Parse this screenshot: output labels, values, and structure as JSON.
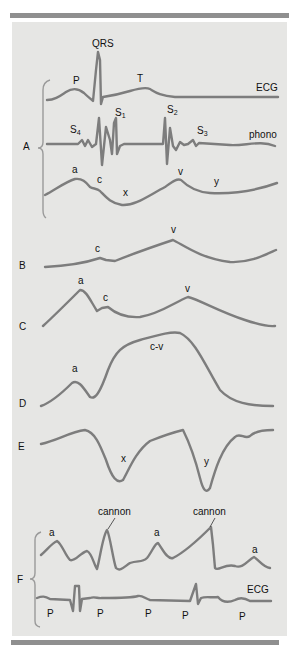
{
  "figure": {
    "panels": [
      {
        "id": "A",
        "label": "A",
        "traces": [
          {
            "name": "ECG",
            "label": "ECG",
            "annotations": [
              "P",
              "QRS",
              "T"
            ]
          },
          {
            "name": "phono",
            "label": "phono",
            "annotations": [
              "S4",
              "S1",
              "S2",
              "S3"
            ]
          },
          {
            "name": "jvp",
            "label": "",
            "annotations": [
              "a",
              "c",
              "x",
              "v",
              "y"
            ]
          }
        ]
      },
      {
        "id": "B",
        "label": "B",
        "annotations": [
          "c",
          "v"
        ]
      },
      {
        "id": "C",
        "label": "C",
        "annotations": [
          "a",
          "c",
          "v"
        ]
      },
      {
        "id": "D",
        "label": "D",
        "annotations": [
          "a",
          "c-v"
        ]
      },
      {
        "id": "E",
        "label": "E",
        "annotations": [
          "x",
          "y"
        ]
      },
      {
        "id": "F",
        "label": "F",
        "traces": [
          {
            "name": "jvp",
            "annotations": [
              "a",
              "cannon",
              "a",
              "cannon",
              "a"
            ]
          },
          {
            "name": "ECG",
            "label": "ECG",
            "annotations": [
              "P",
              "P",
              "P",
              "P",
              "P"
            ]
          }
        ]
      }
    ]
  },
  "labels": {
    "A": "A",
    "B": "B",
    "C": "C",
    "D": "D",
    "E": "E",
    "F": "F",
    "qrs": "QRS",
    "p": "P",
    "t": "T",
    "ecg": "ECG",
    "phono": "phono",
    "s4": "S",
    "s4_sub": "4",
    "s1": "S",
    "s1_sub": "1",
    "s2": "S",
    "s2_sub": "2",
    "s3": "S",
    "s3_sub": "3",
    "a": "a",
    "c": "c",
    "x": "x",
    "v": "v",
    "y": "y",
    "cv": "c-v",
    "cannon": "cannon"
  },
  "colors": {
    "panel_bg": "#e6e6e4",
    "trace": "#7d7d7d",
    "rule": "#8f8f8f",
    "text": "#111111"
  }
}
